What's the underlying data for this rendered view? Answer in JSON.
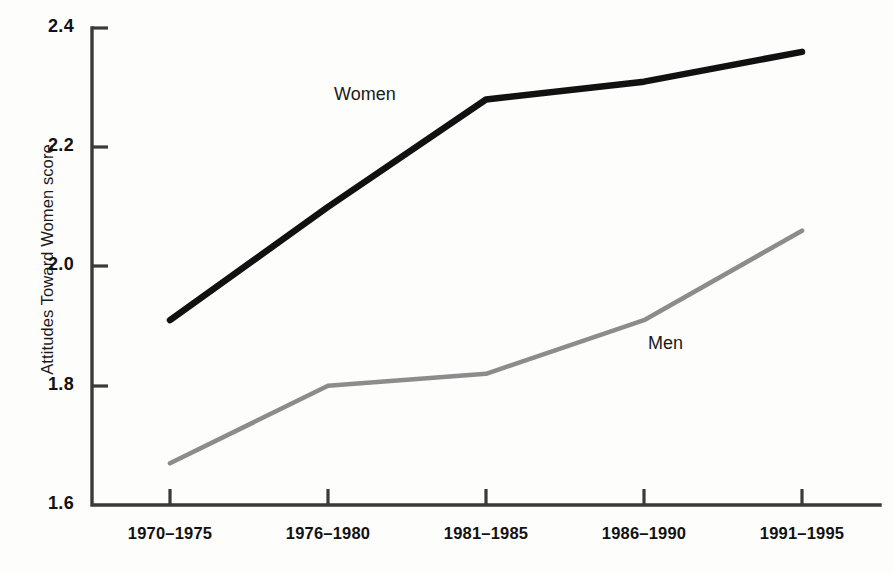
{
  "chart_data": {
    "type": "line",
    "title": "",
    "subtitle": "",
    "xlabel": "",
    "ylabel": "Attitudes Toward Women score",
    "categories": [
      "1970–1975",
      "1976–1980",
      "1981–1985",
      "1986–1990",
      "1991–1995"
    ],
    "series": [
      {
        "name": "Women",
        "color": "#111111",
        "values": [
          1.91,
          2.1,
          2.28,
          2.31,
          2.36
        ]
      },
      {
        "name": "Men",
        "color": "#8c8c8c",
        "values": [
          1.67,
          1.8,
          1.82,
          1.91,
          2.06
        ]
      }
    ],
    "ylim": [
      1.6,
      2.4
    ],
    "yticks": [
      "1.6",
      "1.8",
      "2.0",
      "2.2",
      "2.4"
    ],
    "ytick_values": [
      1.6,
      1.8,
      2.0,
      2.2,
      2.4
    ],
    "grid": false,
    "legend": "inline-annotations",
    "annotations": [
      {
        "text": "Women",
        "series": "Women"
      },
      {
        "text": "Men",
        "series": "Men"
      }
    ]
  },
  "axis": {
    "y_title": "Attitudes Toward Women score"
  },
  "colors": {
    "women_line": "#111111",
    "men_line": "#8c8c8c",
    "axis": "#3a3a3a",
    "background": "#fdfdfc"
  }
}
